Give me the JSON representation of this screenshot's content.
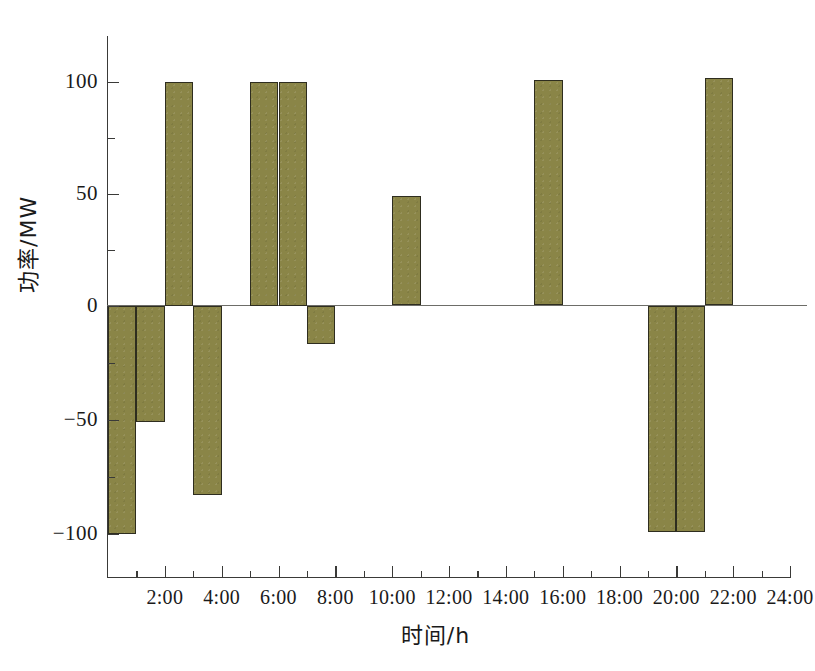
{
  "chart_data": {
    "type": "bar",
    "title": "",
    "xlabel": "时间/h",
    "ylabel": "功率/MW",
    "xlim": [
      0,
      24
    ],
    "ylim": [
      -120,
      120
    ],
    "grid": false,
    "legend": null,
    "bar_color": "#8a8547",
    "bar_edge_color": "#2e2d1f",
    "x_tick_labels": [
      "2:00",
      "4:00",
      "6:00",
      "8:00",
      "10:00",
      "12:00",
      "14:00",
      "16:00",
      "18:00",
      "20:00",
      "22:00",
      "24:00"
    ],
    "x_tick_values": [
      2,
      4,
      6,
      8,
      10,
      12,
      14,
      16,
      18,
      20,
      22,
      24
    ],
    "x_minor_ticks": [
      1,
      3,
      5,
      7,
      9,
      11,
      13,
      15,
      17,
      19,
      21,
      23
    ],
    "y_tick_labels": [
      "100",
      "50",
      "0",
      "-50",
      "-100"
    ],
    "y_tick_values": [
      100,
      50,
      0,
      -50,
      -100
    ],
    "y_minor_ticks": [
      75,
      25,
      -25,
      -75
    ],
    "categories": [
      "0-1",
      "1-2",
      "2-3",
      "3-4",
      "4-5",
      "5-6",
      "6-7",
      "7-8",
      "8-9",
      "9-10",
      "10-11",
      "11-12",
      "12-13",
      "13-14",
      "14-15",
      "15-16",
      "16-17",
      "17-18",
      "18-19",
      "19-20",
      "20-21",
      "21-22",
      "22-23",
      "23-24"
    ],
    "x_starts": [
      0,
      1,
      2,
      3,
      4,
      5,
      6,
      7,
      8,
      9,
      10,
      11,
      12,
      13,
      14,
      15,
      16,
      17,
      18,
      19,
      20,
      21,
      22,
      23
    ],
    "values": [
      -100,
      -51,
      100,
      -83,
      0,
      100,
      100,
      -17,
      0,
      0,
      49,
      0,
      0,
      0,
      0,
      101,
      0,
      0,
      0,
      -99,
      -99,
      102,
      0,
      0
    ],
    "bars": [
      {
        "hour_start": 0,
        "hour_end": 1,
        "value": -100
      },
      {
        "hour_start": 1,
        "hour_end": 2,
        "value": -51
      },
      {
        "hour_start": 2,
        "hour_end": 3,
        "value": 100
      },
      {
        "hour_start": 3,
        "hour_end": 4,
        "value": -83
      },
      {
        "hour_start": 5,
        "hour_end": 6,
        "value": 100
      },
      {
        "hour_start": 6,
        "hour_end": 7,
        "value": 100
      },
      {
        "hour_start": 7,
        "hour_end": 8,
        "value": -17
      },
      {
        "hour_start": 10,
        "hour_end": 11,
        "value": 49
      },
      {
        "hour_start": 15,
        "hour_end": 16,
        "value": 101
      },
      {
        "hour_start": 19,
        "hour_end": 20,
        "value": -99
      },
      {
        "hour_start": 20,
        "hour_end": 21,
        "value": -99
      },
      {
        "hour_start": 21,
        "hour_end": 22,
        "value": 102
      }
    ]
  }
}
